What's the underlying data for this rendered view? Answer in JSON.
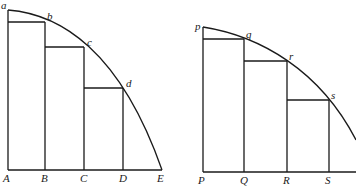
{
  "figures": [
    {
      "name": "left-figure",
      "base_labels": [
        "A",
        "B",
        "C",
        "D",
        "E"
      ],
      "curve_labels": [
        "a",
        "b",
        "c",
        "d"
      ]
    },
    {
      "name": "right-figure",
      "base_labels": [
        "P",
        "Q",
        "R",
        "S"
      ],
      "curve_labels": [
        "p",
        "q",
        "r",
        "s"
      ]
    }
  ]
}
